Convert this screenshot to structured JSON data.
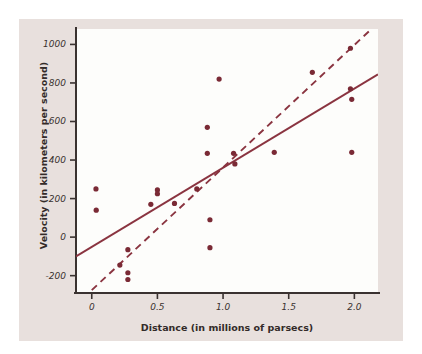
{
  "chart_data": {
    "type": "scatter",
    "title": "",
    "xlabel": "Distance (in millions of parsecs)",
    "ylabel": "Velocity (in kilometers per second)",
    "xlim": [
      -0.12,
      2.18
    ],
    "ylim": [
      -290,
      1080
    ],
    "xticks": [
      0,
      0.5,
      1.0,
      1.5,
      2.0
    ],
    "xtick_labels": [
      "0",
      "0.5",
      "1.0",
      "1.5",
      "2.0"
    ],
    "yticks": [
      -200,
      0,
      200,
      400,
      600,
      800,
      1000
    ],
    "ytick_labels": [
      "-200",
      "0",
      "200",
      "400",
      "600",
      "800",
      "1000"
    ],
    "grid": false,
    "legend": false,
    "points": [
      {
        "x": 0.032,
        "y": 250
      },
      {
        "x": 0.034,
        "y": 140
      },
      {
        "x": 0.214,
        "y": -145
      },
      {
        "x": 0.275,
        "y": -65
      },
      {
        "x": 0.275,
        "y": -185
      },
      {
        "x": 0.275,
        "y": -220
      },
      {
        "x": 0.45,
        "y": 170
      },
      {
        "x": 0.5,
        "y": 245
      },
      {
        "x": 0.5,
        "y": 225
      },
      {
        "x": 0.63,
        "y": 175
      },
      {
        "x": 0.8,
        "y": 250
      },
      {
        "x": 0.88,
        "y": 435
      },
      {
        "x": 0.88,
        "y": 570
      },
      {
        "x": 0.9,
        "y": 90
      },
      {
        "x": 0.9,
        "y": -55
      },
      {
        "x": 0.97,
        "y": 820
      },
      {
        "x": 1.08,
        "y": 435
      },
      {
        "x": 1.09,
        "y": 380
      },
      {
        "x": 1.39,
        "y": 440
      },
      {
        "x": 1.68,
        "y": 855
      },
      {
        "x": 1.97,
        "y": 980
      },
      {
        "x": 1.97,
        "y": 770
      },
      {
        "x": 1.98,
        "y": 715
      },
      {
        "x": 1.98,
        "y": 440
      }
    ],
    "lines": [
      {
        "name": "solid-fit-line",
        "style": "solid",
        "x0": -0.12,
        "y0": -100,
        "x1": 2.18,
        "y1": 845
      },
      {
        "name": "dashed-fit-line",
        "style": "dashed",
        "x0": 0.0,
        "y0": -275,
        "x1": 2.13,
        "y1": 1080
      }
    ],
    "colors": {
      "point": "#7a2a35",
      "solid_line": "#8a3440",
      "dashed_line": "#8a3440",
      "axis": "#3a3230",
      "panel_background": "#fdfdfb",
      "page_background": "#e8e0dd"
    }
  }
}
